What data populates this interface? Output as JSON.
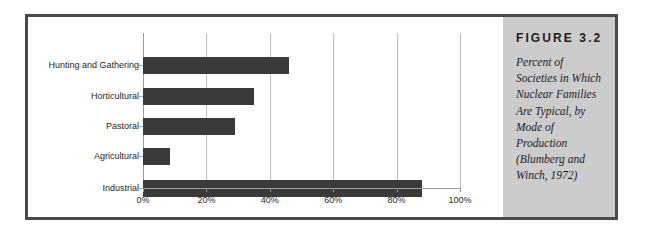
{
  "figure": {
    "number_label": "FIGURE 3.2",
    "caption": "Percent of Societies in Which Nuclear Families Are Typical, by Mode of Production (Blumberg and Winch, 1972)"
  },
  "colors": {
    "frame_border": "#4a4a4a",
    "caption_panel_bg": "#cccccc",
    "bar_fill": "#3a3a3a",
    "gridline": "#b9b9b9",
    "plot_bg": "#ffffff",
    "text": "#1c1c1c"
  },
  "chart_data": {
    "type": "bar",
    "orientation": "horizontal",
    "title": "",
    "subtitle": "",
    "xlabel": "",
    "ylabel": "",
    "categories": [
      "Hunting and Gathering",
      "Horticultural",
      "Pastoral",
      "Agricultural",
      "Industrial"
    ],
    "values": [
      46,
      35,
      29,
      8.5,
      88
    ],
    "value_unit": "%",
    "xlim": [
      0,
      100
    ],
    "xticks": [
      0,
      20,
      40,
      60,
      80,
      100
    ],
    "xtick_labels": [
      "0%",
      "20%",
      "40%",
      "60%",
      "80%",
      "100%"
    ],
    "grid": "vertical",
    "legend": "none",
    "series": [
      {
        "name": "Percent of Societies",
        "values": [
          46,
          35,
          29,
          8.5,
          88
        ]
      }
    ]
  }
}
